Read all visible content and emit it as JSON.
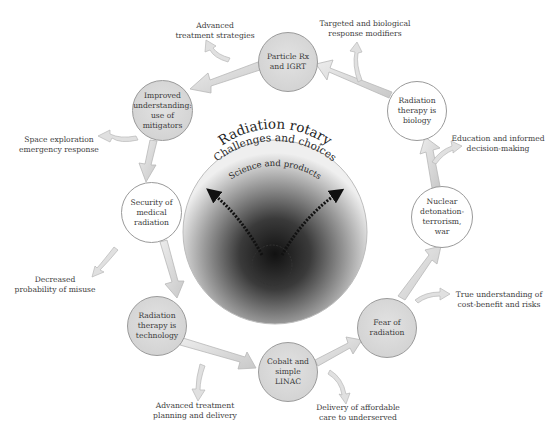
{
  "diagram": {
    "center": {
      "title": "Radiation rotary",
      "subtitle": "Challenges and choices",
      "tagline": "Science and products"
    },
    "nodes": [
      {
        "id": "particle",
        "text": "Particle Rx and IGRT",
        "style": "shaded"
      },
      {
        "id": "biology",
        "text": "Radiation therapy is biology",
        "style": "white"
      },
      {
        "id": "nuclear",
        "text": "Nuclear detonation- terrorism, war",
        "style": "white"
      },
      {
        "id": "fear",
        "text": "Fear of radiation",
        "style": "shaded"
      },
      {
        "id": "cobalt",
        "text": "Cobalt and simple LINAC",
        "style": "shaded"
      },
      {
        "id": "technology",
        "text": "Radiation therapy is technology",
        "style": "shaded"
      },
      {
        "id": "security",
        "text": "Security of medical radiation",
        "style": "white"
      },
      {
        "id": "improved",
        "text": "Improved understanding: use of mitigators",
        "style": "shaded"
      }
    ],
    "outcomes": [
      {
        "id": "advanced-strategies",
        "line1": "Advanced",
        "line2": "treatment strategies"
      },
      {
        "id": "targeted",
        "line1": "Targeted and biological",
        "line2": "response modifiers"
      },
      {
        "id": "education",
        "line1": "Education and informed",
        "line2": "decision-making"
      },
      {
        "id": "true-understanding",
        "line1": "True understanding of",
        "line2": "cost-benefit and risks"
      },
      {
        "id": "delivery",
        "line1": "Delivery of affordable",
        "line2": "care to underserved"
      },
      {
        "id": "advanced-planning",
        "line1": "Advanced treatment",
        "line2": "planning and delivery"
      },
      {
        "id": "decreased-misuse",
        "line1": "Decreased",
        "line2": "probability of misuse"
      },
      {
        "id": "space",
        "line1": "Space exploration",
        "line2": "emergency response"
      }
    ],
    "colors": {
      "arrow_fill": "#d9d9d9",
      "arrow_stroke": "#b8b8b8",
      "node_shaded": "#d6d6d6",
      "node_border": "#9a9a9a",
      "center_dark": "#1a1a1a",
      "text": "#3a3a3a"
    }
  }
}
